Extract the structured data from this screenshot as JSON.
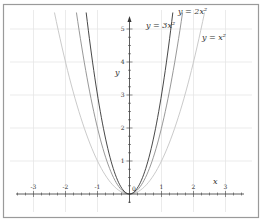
{
  "chart_data": {
    "type": "line",
    "title": "",
    "xlabel": "x",
    "ylabel": "y",
    "xlim": [
      -3.5,
      3.5
    ],
    "ylim": [
      -0.3,
      5.5
    ],
    "grid": true,
    "legend_position": "inline labels near curves",
    "x_ticks": [
      -3,
      -2,
      -1,
      0,
      1,
      2,
      3
    ],
    "x_tick_labels": [
      "-3",
      "-2",
      "-1",
      "",
      "1",
      "2",
      "3"
    ],
    "y_ticks": [
      1,
      2,
      3,
      4,
      5
    ],
    "y_tick_labels": [
      "1",
      "2",
      "3",
      "4",
      "5"
    ],
    "origin_label": "0",
    "series": [
      {
        "name": "y = 3x²",
        "formula": "3*x^2",
        "coef": 3,
        "color": "#333333",
        "x": [
          -1.3,
          -1,
          -0.5,
          0,
          0.5,
          1,
          1.3
        ],
        "values": [
          5.07,
          3,
          0.75,
          0,
          0.75,
          3,
          5.07
        ]
      },
      {
        "name": "y = 2x²",
        "formula": "2*x^2",
        "coef": 2,
        "color": "#8c8c8c",
        "x": [
          -1.6,
          -1,
          -0.5,
          0,
          0.5,
          1,
          1.6
        ],
        "values": [
          5.12,
          2,
          0.5,
          0,
          0.5,
          2,
          5.12
        ]
      },
      {
        "name": "y = x²",
        "formula": "x^2",
        "coef": 1,
        "color": "#c4c4c4",
        "x": [
          -2.3,
          -2,
          -1,
          0,
          1,
          2,
          2.3
        ],
        "values": [
          5.29,
          4,
          1,
          0,
          1,
          4,
          5.29
        ]
      }
    ]
  },
  "labels": {
    "curve_3": "y = 3x²",
    "curve_2": "y = 2x²",
    "curve_1": "y = x²",
    "x_axis": "x",
    "y_axis": "y",
    "origin": "0"
  }
}
